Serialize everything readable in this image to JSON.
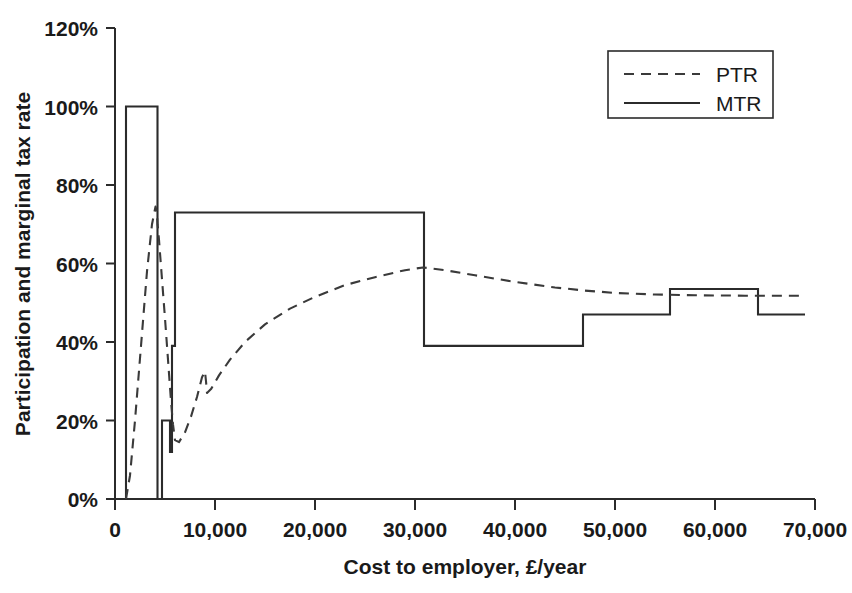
{
  "chart_data": {
    "type": "line",
    "title": "",
    "xlabel": "Cost to employer, £/year",
    "ylabel": "Participation and marginal tax rate",
    "xlim": [
      0,
      70000
    ],
    "ylim": [
      0,
      1.2
    ],
    "grid": false,
    "legend_position": "top-right",
    "x_tick_labels": [
      "0",
      "10,000",
      "20,000",
      "30,000",
      "40,000",
      "50,000",
      "60,000",
      "70,000"
    ],
    "x_tick_values": [
      0,
      10000,
      20000,
      30000,
      40000,
      50000,
      60000,
      70000
    ],
    "y_tick_labels": [
      "0%",
      "20%",
      "40%",
      "60%",
      "80%",
      "100%",
      "120%"
    ],
    "y_tick_values": [
      0,
      0.2,
      0.4,
      0.6,
      0.8,
      1.0,
      1.2
    ],
    "series": [
      {
        "name": "PTR",
        "style": "dashed",
        "color": "#3a3a3a",
        "x": [
          1100,
          1500,
          2000,
          2600,
          3200,
          3700,
          4050,
          4200,
          4250,
          4300,
          4400,
          4700,
          5000,
          5200,
          5400,
          5600,
          5800,
          6000,
          6400,
          7000,
          7600,
          8200,
          8700,
          9000,
          9100,
          9200,
          9600,
          10400,
          11500,
          13000,
          15000,
          17500,
          20000,
          23000,
          26000,
          29000,
          30800,
          33000,
          36000,
          40000,
          44000,
          47000,
          50000,
          54000,
          58000,
          63000,
          69000
        ],
        "y": [
          0.0,
          0.06,
          0.2,
          0.39,
          0.58,
          0.7,
          0.745,
          0.73,
          0.7,
          0.69,
          0.66,
          0.56,
          0.46,
          0.39,
          0.32,
          0.25,
          0.19,
          0.15,
          0.145,
          0.17,
          0.21,
          0.26,
          0.31,
          0.325,
          0.3,
          0.27,
          0.28,
          0.315,
          0.355,
          0.4,
          0.445,
          0.485,
          0.515,
          0.545,
          0.565,
          0.583,
          0.59,
          0.583,
          0.57,
          0.553,
          0.539,
          0.531,
          0.525,
          0.521,
          0.519,
          0.518,
          0.518
        ]
      },
      {
        "name": "MTR",
        "style": "solid-step",
        "color": "#2b2b2b",
        "steps": [
          {
            "x0": 0,
            "x1": 1100,
            "y": 0.0
          },
          {
            "x0": 1100,
            "x1": 4250,
            "y": 1.0
          },
          {
            "x0": 4250,
            "x1": 4300,
            "y": 0.0
          },
          {
            "x0": 4300,
            "x1": 4700,
            "y": 0.0
          },
          {
            "x0": 4700,
            "x1": 5500,
            "y": 0.2
          },
          {
            "x0": 5500,
            "x1": 5700,
            "y": 0.12
          },
          {
            "x0": 5700,
            "x1": 6000,
            "y": 0.39
          },
          {
            "x0": 6000,
            "x1": 6100,
            "y": 0.73
          },
          {
            "x0": 6100,
            "x1": 30900,
            "y": 0.73
          },
          {
            "x0": 30900,
            "x1": 46800,
            "y": 0.39
          },
          {
            "x0": 46800,
            "x1": 55500,
            "y": 0.47
          },
          {
            "x0": 55500,
            "x1": 64300,
            "y": 0.535
          },
          {
            "x0": 64300,
            "x1": 69000,
            "y": 0.47
          }
        ]
      }
    ]
  },
  "legend": {
    "entries": [
      {
        "label": "PTR",
        "style": "dashed"
      },
      {
        "label": "MTR",
        "style": "solid"
      }
    ]
  }
}
